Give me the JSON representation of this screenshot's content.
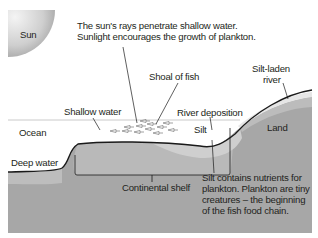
{
  "diagram": {
    "labels": {
      "sun": "Sun",
      "sun_caption_line1": "The sun's rays penetrate shallow water.",
      "sun_caption_line2": "Sunlight encourages the growth of plankton.",
      "shoal_of_fish": "Shoal of fish",
      "silt_laden_river_line1": "Silt-laden",
      "silt_laden_river_line2": "river",
      "shallow_water": "Shallow water",
      "river_deposition": "River deposition",
      "ocean": "Ocean",
      "silt": "Silt",
      "land": "Land",
      "deep_water": "Deep water",
      "continental_shelf": "Continental shelf",
      "silt_note_line1": "Silt contains nutrients for",
      "silt_note_line2": "plankton. Plankton are tiny",
      "silt_note_line3": "creatures – the beginning",
      "silt_note_line4": "of the fish food chain."
    },
    "colors": {
      "bedrock": "#a7a7a7",
      "sediment_light": "#c4c4c4",
      "shelf_band": "#b6b6b6",
      "ocean": "#ffffff",
      "river": "#d9d9d9",
      "outline": "#1a1a1a",
      "text": "#231f20"
    }
  }
}
